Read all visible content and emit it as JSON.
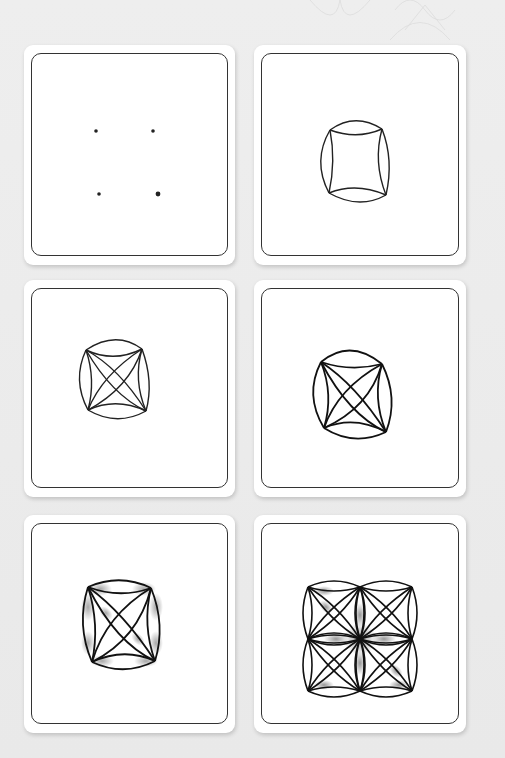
{
  "page": {
    "background_color": "#ececec",
    "ink_color": "#222222",
    "shade_color": "#9a9a9a"
  },
  "tiles": [
    {
      "step": 1,
      "description": "Four dots placed in a square",
      "position": "row1-left"
    },
    {
      "step": 2,
      "description": "Dots connected with concave arcs and outer convex arcs forming a pillow shape",
      "position": "row1-right"
    },
    {
      "step": 3,
      "description": "Diagonal crossing leaf shapes added inside the inner square",
      "position": "row2-left"
    },
    {
      "step": 4,
      "description": "Lines thickened and leaf shapes refined",
      "position": "row2-right"
    },
    {
      "step": 5,
      "description": "Graphite shading added near the corners",
      "position": "row3-left"
    },
    {
      "step": 6,
      "description": "Pattern repeated in a 2x2 grid with shading",
      "position": "row3-right"
    }
  ]
}
